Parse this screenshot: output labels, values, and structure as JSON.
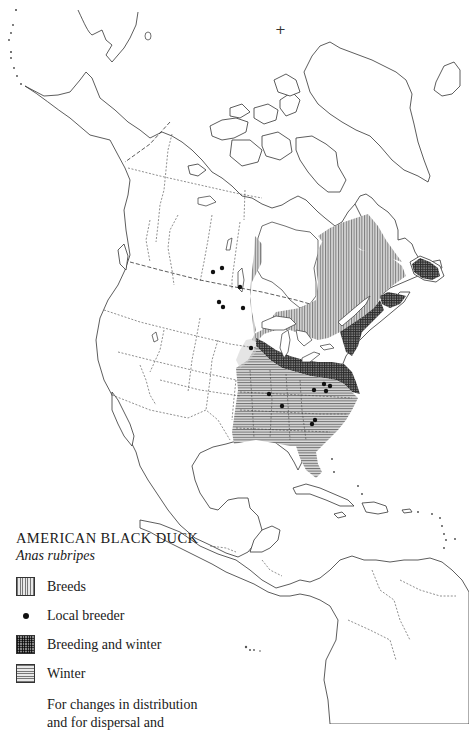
{
  "map": {
    "title": "AMERICAN BLACK DUCK",
    "scientific_name": "Anas rubripes",
    "region": "North and Central America",
    "north_pole_marker": "+",
    "colors": {
      "breeds": "#9a9a9a",
      "breeding_and_winter": "#4a4a4a",
      "winter": "#a8a8a8",
      "coastline": "#333333",
      "background": "#ffffff"
    }
  },
  "legend": {
    "items": [
      {
        "key": "breeds",
        "label": "Breeds",
        "symbol": "vertical-hatch-swatch"
      },
      {
        "key": "local_breeder",
        "label": "Local breeder",
        "symbol": "dot"
      },
      {
        "key": "breeding_and_winter",
        "label": "Breeding and winter",
        "symbol": "crosshatch-swatch"
      },
      {
        "key": "winter",
        "label": "Winter",
        "symbol": "horizontal-hatch-swatch"
      }
    ],
    "note_lines": [
      "For changes in distribution",
      "and for dispersal and"
    ]
  }
}
